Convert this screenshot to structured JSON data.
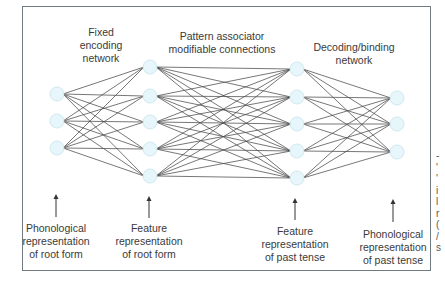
{
  "diagram": {
    "type": "neural-network",
    "colors": {
      "frame": "#6f7b80",
      "node_fill": "#e6f6fa",
      "node_stroke": "#cfe9f0",
      "edge": "#4a4a4a",
      "text": "#3a3a3a"
    },
    "layers": [
      {
        "id": "phonological-root",
        "x": 57,
        "nodes_y": [
          94,
          121,
          148
        ]
      },
      {
        "id": "feature-root",
        "x": 150,
        "nodes_y": [
          67,
          96,
          122,
          149,
          176
        ]
      },
      {
        "id": "feature-past",
        "x": 297,
        "nodes_y": [
          69,
          97,
          124,
          151,
          178
        ]
      },
      {
        "id": "phonological-past",
        "x": 397,
        "nodes_y": [
          98,
          124,
          152
        ]
      }
    ],
    "top_labels": [
      {
        "lines": [
          "Fixed",
          "encoding",
          "network"
        ],
        "x": 101,
        "y": 26
      },
      {
        "lines": [
          "Pattern associator",
          "modifiable connections"
        ],
        "x": 222,
        "y": 30
      },
      {
        "lines": [
          "Decoding/binding",
          "network"
        ],
        "x": 354,
        "y": 41
      }
    ],
    "bottom_labels": [
      {
        "lines": [
          "Phonological",
          "representation",
          "of root form"
        ],
        "x": 56,
        "y": 222,
        "arrow_top": 194,
        "arrow_bottom": 217
      },
      {
        "lines": [
          "Feature",
          "representation",
          "of root form"
        ],
        "x": 149,
        "y": 222,
        "arrow_top": 196,
        "arrow_bottom": 218
      },
      {
        "lines": [
          "Feature",
          "representation",
          "of past tense"
        ],
        "x": 295,
        "y": 225,
        "arrow_top": 198,
        "arrow_bottom": 220
      },
      {
        "lines": [
          "Phonological",
          "representation",
          "of past tense"
        ],
        "x": 393,
        "y": 228,
        "arrow_top": 199,
        "arrow_bottom": 222
      }
    ],
    "clipped_margin_text": [
      "-",
      "'",
      "'",
      "i",
      "l",
      "r",
      "(",
      "/",
      "s"
    ]
  }
}
